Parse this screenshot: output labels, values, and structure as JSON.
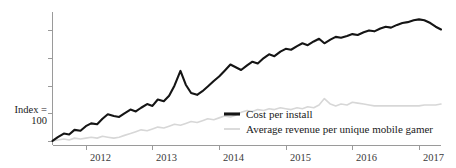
{
  "chart_data": {
    "type": "line",
    "title": "",
    "subtitle": "",
    "xlabel": "",
    "ylabel": "Index = 100",
    "ylabel_line1": "Index =",
    "ylabel_line2": "100",
    "grid": false,
    "legend_position": "bottom-right",
    "xlim": [
      2011.5,
      2017.33
    ],
    "ylim": [
      95,
      240
    ],
    "xticks": [
      2012,
      2013,
      2014,
      2015,
      2016,
      2017
    ],
    "xtick_labels": [
      "2012",
      "2013",
      "2014",
      "2015",
      "2016",
      "2017"
    ],
    "yticks": [
      100,
      130,
      160,
      190,
      220
    ],
    "ytick_labels": [
      "",
      "",
      "",
      "",
      ""
    ],
    "colors": {
      "primary": "#151515",
      "secondary": "#d7d7d7",
      "axis": "#9a9a9a",
      "text": "#1a1a1a",
      "background": "#ffffff"
    },
    "series": [
      {
        "name": "Cost per install",
        "color": "#151515",
        "x": [
          2011.5,
          2011.58,
          2011.67,
          2011.75,
          2011.83,
          2011.92,
          2012.0,
          2012.08,
          2012.17,
          2012.25,
          2012.33,
          2012.42,
          2012.5,
          2012.58,
          2012.67,
          2012.75,
          2012.83,
          2012.92,
          2013.0,
          2013.08,
          2013.17,
          2013.25,
          2013.33,
          2013.42,
          2013.5,
          2013.58,
          2013.67,
          2013.75,
          2013.83,
          2013.92,
          2014.0,
          2014.08,
          2014.17,
          2014.25,
          2014.33,
          2014.42,
          2014.5,
          2014.58,
          2014.67,
          2014.75,
          2014.83,
          2014.92,
          2015.0,
          2015.08,
          2015.17,
          2015.25,
          2015.33,
          2015.42,
          2015.5,
          2015.58,
          2015.67,
          2015.75,
          2015.83,
          2015.92,
          2016.0,
          2016.08,
          2016.17,
          2016.25,
          2016.33,
          2016.42,
          2016.5,
          2016.58,
          2016.67,
          2016.75,
          2016.83,
          2016.92,
          2017.0,
          2017.08,
          2017.17,
          2017.25,
          2017.33
        ],
        "values": [
          100,
          104,
          108,
          107,
          112,
          111,
          116,
          119,
          118,
          124,
          129,
          127,
          126,
          130,
          134,
          132,
          136,
          140,
          138,
          145,
          143,
          149,
          160,
          176,
          161,
          152,
          150,
          154,
          159,
          165,
          170,
          176,
          183,
          180,
          177,
          182,
          186,
          184,
          190,
          194,
          192,
          197,
          200,
          199,
          203,
          206,
          204,
          208,
          211,
          206,
          210,
          213,
          212,
          214,
          216,
          215,
          218,
          220,
          219,
          222,
          224,
          223,
          226,
          228,
          229,
          231,
          232,
          231,
          228,
          224,
          221
        ]
      },
      {
        "name": "Average revenue per unique mobile gamer",
        "color": "#d7d7d7",
        "x": [
          2011.5,
          2011.58,
          2011.67,
          2011.75,
          2011.83,
          2011.92,
          2012.0,
          2012.08,
          2012.17,
          2012.25,
          2012.33,
          2012.42,
          2012.5,
          2012.58,
          2012.67,
          2012.75,
          2012.83,
          2012.92,
          2013.0,
          2013.08,
          2013.17,
          2013.25,
          2013.33,
          2013.42,
          2013.5,
          2013.58,
          2013.67,
          2013.75,
          2013.83,
          2013.92,
          2014.0,
          2014.08,
          2014.17,
          2014.25,
          2014.33,
          2014.42,
          2014.5,
          2014.58,
          2014.67,
          2014.75,
          2014.83,
          2014.92,
          2015.0,
          2015.08,
          2015.17,
          2015.25,
          2015.33,
          2015.42,
          2015.5,
          2015.58,
          2015.67,
          2015.75,
          2015.83,
          2015.92,
          2016.0,
          2016.08,
          2016.17,
          2016.25,
          2016.33,
          2016.42,
          2016.5,
          2016.58,
          2016.67,
          2016.75,
          2016.83,
          2016.92,
          2017.0,
          2017.08,
          2017.17,
          2017.25,
          2017.33
        ],
        "values": [
          100,
          101,
          102,
          101,
          103,
          102,
          103,
          104,
          103,
          105,
          104,
          103,
          104,
          106,
          108,
          110,
          112,
          111,
          113,
          115,
          114,
          116,
          118,
          117,
          119,
          121,
          120,
          122,
          124,
          123,
          125,
          127,
          126,
          128,
          131,
          133,
          132,
          134,
          133,
          135,
          134,
          136,
          135,
          134,
          136,
          135,
          137,
          136,
          139,
          146,
          140,
          138,
          140,
          139,
          142,
          141,
          140,
          139,
          138,
          138,
          138,
          138,
          138,
          138,
          138,
          138,
          138,
          139,
          139,
          139,
          140
        ]
      }
    ]
  },
  "legend": {
    "items": [
      {
        "label": "Cost per install",
        "color": "#151515"
      },
      {
        "label": "Average revenue per unique mobile gamer",
        "color": "#d7d7d7"
      }
    ]
  }
}
